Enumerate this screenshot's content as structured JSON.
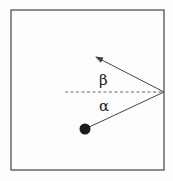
{
  "diagram": {
    "type": "reflection",
    "box": {
      "x": 11,
      "y": 10,
      "width": 153,
      "height": 160
    },
    "ball": {
      "cx": 85,
      "cy": 129,
      "r": 5.5
    },
    "reflection_point": {
      "x": 164,
      "y": 92
    },
    "outgoing_tip": {
      "x": 95,
      "y": 57
    },
    "normal_dashed_start_x": 65,
    "labels": {
      "incidence_angle": "α",
      "reflection_angle": "β"
    },
    "colors": {
      "stroke": "#444444",
      "ball": "#1a1a1a",
      "background": "#fdfdfb"
    }
  }
}
